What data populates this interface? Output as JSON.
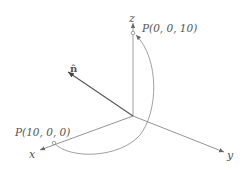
{
  "diagram": {
    "axes": {
      "x_label": "x",
      "y_label": "y",
      "z_label": "z"
    },
    "normal_label": "n̂",
    "points": {
      "start": {
        "label": "P(0, 0, 10)",
        "coords": [
          0,
          0,
          10
        ]
      },
      "end": {
        "label": "P(10, 0, 0)",
        "coords": [
          10,
          0,
          0
        ]
      }
    },
    "colors": {
      "axis": "#777777",
      "normal": "#555555",
      "arc": "#888888",
      "text": "#555555"
    }
  }
}
